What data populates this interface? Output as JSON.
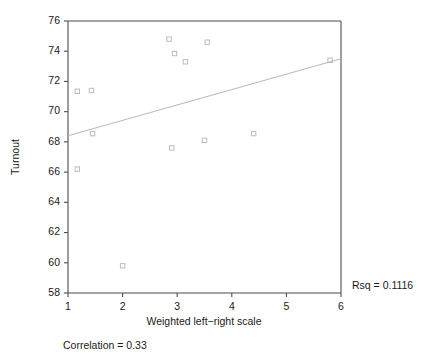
{
  "chart_data": {
    "type": "scatter",
    "title": "",
    "xlabel": "Weighted left−right scale",
    "ylabel": "Turnout",
    "xlim": [
      1,
      6
    ],
    "ylim": [
      58,
      76
    ],
    "xticks": [
      1,
      2,
      3,
      4,
      5,
      6
    ],
    "yticks": [
      58,
      60,
      62,
      64,
      66,
      68,
      70,
      72,
      74,
      76
    ],
    "xtick_labels": [
      "1",
      "2",
      "3",
      "4",
      "5",
      "6"
    ],
    "ytick_labels": [
      "58",
      "60",
      "62",
      "64",
      "66",
      "68",
      "70",
      "72",
      "74",
      "76"
    ],
    "grid": false,
    "legend": null,
    "marker_style": "open-square",
    "points": [
      {
        "x": 1.17,
        "y": 66.2
      },
      {
        "x": 1.17,
        "y": 71.35
      },
      {
        "x": 1.43,
        "y": 71.4
      },
      {
        "x": 1.45,
        "y": 68.55
      },
      {
        "x": 2.0,
        "y": 59.8
      },
      {
        "x": 2.85,
        "y": 74.8
      },
      {
        "x": 2.9,
        "y": 67.6
      },
      {
        "x": 2.95,
        "y": 73.85
      },
      {
        "x": 3.15,
        "y": 73.3
      },
      {
        "x": 3.5,
        "y": 68.1
      },
      {
        "x": 3.55,
        "y": 74.6
      },
      {
        "x": 4.4,
        "y": 68.55
      },
      {
        "x": 5.8,
        "y": 73.4
      }
    ],
    "fit_line": {
      "type": "linear-regression",
      "x_start": 1.0,
      "y_start": 68.4,
      "x_end": 6.0,
      "y_end": 73.5
    },
    "annotations": {
      "rsq": "Rsq = 0.1116",
      "correlation": "Correlation = 0.33"
    },
    "colors": {
      "marker": "#b9bcc0",
      "fit_line": "#b9bcc0",
      "axis": "#4d4d4d",
      "text": "#1a1a1a",
      "background": "#ffffff"
    }
  }
}
